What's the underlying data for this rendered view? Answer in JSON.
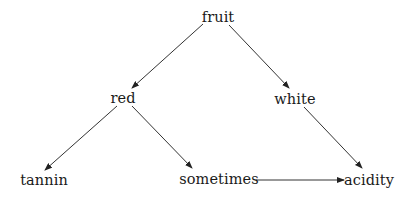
{
  "diagram": {
    "type": "directed-graph",
    "colors": {
      "background": "#ffffff",
      "text": "#1a1a1a",
      "edge": "#333333"
    },
    "nodes": [
      {
        "id": "fruit",
        "label": "fruit",
        "x": 218,
        "y": 10
      },
      {
        "id": "red",
        "label": "red",
        "x": 123,
        "y": 91
      },
      {
        "id": "white",
        "label": "white",
        "x": 295,
        "y": 92
      },
      {
        "id": "tannin",
        "label": "tannin",
        "x": 44,
        "y": 173
      },
      {
        "id": "sometimes",
        "label": "sometimes",
        "x": 219,
        "y": 172
      },
      {
        "id": "acidity",
        "label": "acidity",
        "x": 369,
        "y": 173
      }
    ],
    "edges": [
      {
        "from": "fruit",
        "to": "red",
        "x1": 203,
        "y1": 24,
        "x2": 132,
        "y2": 88
      },
      {
        "from": "fruit",
        "to": "white",
        "x1": 229,
        "y1": 25,
        "x2": 289,
        "y2": 88
      },
      {
        "from": "red",
        "to": "tannin",
        "x1": 117,
        "y1": 106,
        "x2": 45,
        "y2": 170
      },
      {
        "from": "red",
        "to": "sometimes",
        "x1": 132,
        "y1": 106,
        "x2": 192,
        "y2": 168
      },
      {
        "from": "white",
        "to": "acidity",
        "x1": 304,
        "y1": 107,
        "x2": 362,
        "y2": 168
      },
      {
        "from": "sometimes",
        "to": "acidity",
        "x1": 256,
        "y1": 180,
        "x2": 344,
        "y2": 180
      }
    ]
  }
}
